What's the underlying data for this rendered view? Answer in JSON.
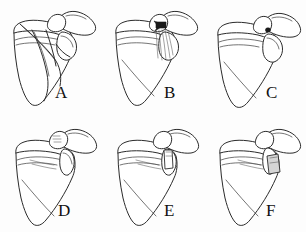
{
  "figure": {
    "background_color": "#fdfdfd",
    "line_color": "#2b2b2b",
    "dark_marker_color": "#1a1a1a",
    "gray_graft_color": "#d5d5d5",
    "columns": 3,
    "rows": 2
  },
  "panels": [
    {
      "id": "panel-a",
      "label": "A",
      "label_x": 55,
      "label_y": 84,
      "structure": "scapula",
      "feature": "fracture-lines",
      "feature_note": "Multiple intersecting osteotomy/fracture lines across the glenoid neck and scapular body"
    },
    {
      "id": "panel-b",
      "label": "B",
      "label_x": 62,
      "label_y": 84,
      "structure": "scapula",
      "feature": "dark-arrow-marker",
      "feature_note": "Solid dark wedge marker at the coracoid base with fine hatching lines running inferiorly"
    },
    {
      "id": "panel-c",
      "label": "C",
      "label_x": 62,
      "label_y": 84,
      "structure": "scapula",
      "feature": "dark-dot-marker",
      "feature_note": "Small solid dot marking the glenoid rim defect"
    },
    {
      "id": "panel-d",
      "label": "D",
      "label_x": 58,
      "label_y": 86,
      "structure": "scapula",
      "feature": "intact-acromion-detail",
      "feature_note": "Intact glenoid with small hatch detail at the acromion and coracoid tip"
    },
    {
      "id": "panel-e",
      "label": "E",
      "label_x": 62,
      "label_y": 86,
      "structure": "scapula",
      "feature": "open-block-graft",
      "feature_note": "Narrow unfilled rectangular block outlined at the anterior glenoid rim"
    },
    {
      "id": "panel-f",
      "label": "F",
      "label_x": 62,
      "label_y": 86,
      "structure": "scapula",
      "feature": "shaded-block-graft",
      "feature_note": "Shaded grey quadrilateral bone-graft block fixed at the anterior glenoid rim"
    }
  ],
  "anatomy_labels": {
    "body": "scapular body",
    "spine": "scapular spine",
    "acromion": "acromion",
    "coracoid": "coracoid process",
    "glenoid": "glenoid fossa",
    "lateral_border": "lateral border",
    "medial_border": "medial border",
    "inferior_angle": "inferior angle"
  }
}
